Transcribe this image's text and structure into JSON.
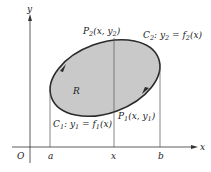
{
  "figure": {
    "colors": {
      "background": "#ffffff",
      "region_fill": "#c9c9c9",
      "curve": "#2a2a2a",
      "axes": "#333333",
      "lines": "#555555"
    },
    "axes": {
      "x_label": "x",
      "y_label": "y",
      "origin_label": "O"
    },
    "ticks": [
      {
        "label": "a"
      },
      {
        "label": "x"
      },
      {
        "label": "b"
      }
    ],
    "region": {
      "label": "R"
    },
    "points": {
      "P2": {
        "name": "P",
        "sub": "2",
        "coords": "(x,  y",
        "coord_sub": "2",
        "close": ")"
      },
      "P1": {
        "name": "P",
        "sub": "1",
        "coords": "(x,  y",
        "coord_sub": "1",
        "close": ")"
      }
    },
    "curves": {
      "C2": {
        "name": "C",
        "sub": "2",
        "eq_left": ": y",
        "eq_left_sub": "2",
        "eq_mid": " = f",
        "eq_mid_sub": "2",
        "eq_right": "(x)"
      },
      "C1": {
        "name": "C",
        "sub": "1",
        "eq_left": ": y",
        "eq_left_sub": "1",
        "eq_mid": " = f",
        "eq_mid_sub": "1",
        "eq_right": "(x)"
      }
    }
  }
}
